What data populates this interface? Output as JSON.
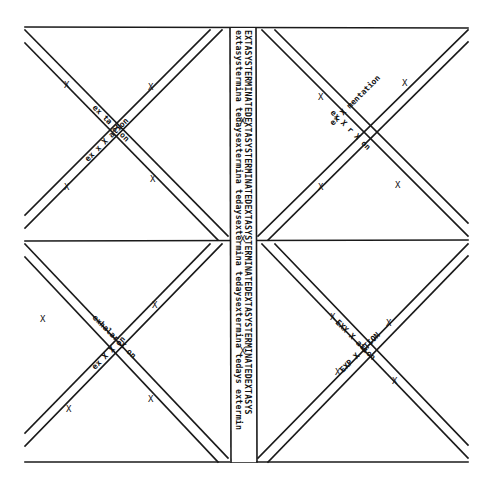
{
  "artwork": {
    "type": "typewriter concrete poem drawing",
    "colors": {
      "ink": "#1a1a1a",
      "paper": "#ffffff"
    },
    "vertical_band": {
      "column_left": "extasystermina tedaysextermina tedaysextermina tedaysextermina tedays extermin",
      "column_right": "EXTASYSTERMINATEDEXTASYSTERMINATEDEXTASYSTERMINATEDEXTASYSTERMINATEDEXTASYS"
    },
    "crossings": {
      "top_left": {
        "band_a": "ex  x  X  ation",
        "band_b": "ex  ta  X  on"
      },
      "top_right": {
        "band_a": "ex  X  mentation",
        "band_b": "ex  X  r  X  on"
      },
      "bottom_left": {
        "band_a": "exhalar  X  on",
        "band_b": "ex  X  X  on"
      },
      "bottom_right": {
        "band_a": "EXX  X  ation",
        "band_b": "EXP  X  ATION"
      }
    },
    "marks": {
      "end_mark": "X"
    }
  }
}
